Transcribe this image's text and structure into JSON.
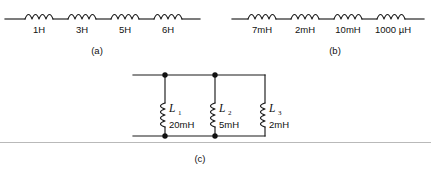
{
  "figure": {
    "background_color": "#ffffff",
    "wire_color": "#1b1b1b",
    "rule_color": "#b9b9b9"
  },
  "circuit_a": {
    "caption": "(a)",
    "arrangement": "series",
    "inductors": [
      {
        "value": "1H"
      },
      {
        "value": "3H"
      },
      {
        "value": "5H"
      },
      {
        "value": "6H"
      }
    ]
  },
  "circuit_b": {
    "caption": "(b)",
    "arrangement": "series",
    "inductors": [
      {
        "value": "7mH"
      },
      {
        "value": "2mH"
      },
      {
        "value": "10mH"
      },
      {
        "value": "1000 µH"
      }
    ]
  },
  "circuit_c": {
    "caption": "(c)",
    "arrangement": "parallel",
    "inductors": [
      {
        "symbol": "L",
        "subscript": "1",
        "value": "20mH"
      },
      {
        "symbol": "L",
        "subscript": "2",
        "value": "5mH"
      },
      {
        "symbol": "L",
        "subscript": "3",
        "value": "2mH"
      }
    ]
  }
}
